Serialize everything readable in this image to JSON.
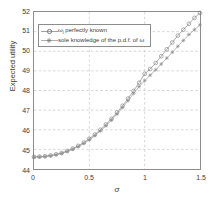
{
  "chart_data": {
    "type": "line",
    "title": "",
    "xlabel": "σ",
    "ylabel": "Expected utility",
    "xlim": [
      0,
      1.5
    ],
    "ylim": [
      44,
      52
    ],
    "xticks": [
      0,
      0.5,
      1,
      1.5
    ],
    "xtick_labels": [
      "0",
      "0.5",
      "1",
      "1.5"
    ],
    "yticks": [
      44,
      45,
      46,
      47,
      48,
      49,
      50,
      51,
      52
    ],
    "ytick_labels": [
      "44",
      "45",
      "46",
      "47",
      "48",
      "49",
      "50",
      "51",
      "52"
    ],
    "grid": true,
    "grid_style": "dashed",
    "legend_position": "upper-left",
    "series": [
      {
        "name": "ωi perfectly known",
        "label_prefix": "ω",
        "label_subscript": "i",
        "label_suffix": " perfectly known",
        "marker": "circle",
        "color": "#8a8a8a",
        "x": [
          0,
          0.05,
          0.1,
          0.15,
          0.2,
          0.25,
          0.3,
          0.35,
          0.4,
          0.45,
          0.5,
          0.55,
          0.6,
          0.65,
          0.7,
          0.75,
          0.8,
          0.85,
          0.9,
          0.95,
          1.0,
          1.05,
          1.1,
          1.15,
          1.2,
          1.25,
          1.3,
          1.35,
          1.4,
          1.45,
          1.5
        ],
        "y": [
          44.62,
          44.63,
          44.65,
          44.69,
          44.75,
          44.82,
          44.92,
          45.04,
          45.18,
          45.35,
          45.54,
          45.76,
          46.0,
          46.27,
          46.56,
          46.88,
          47.22,
          47.59,
          47.98,
          48.4,
          48.85,
          49.1,
          49.4,
          49.75,
          50.1,
          50.45,
          50.8,
          51.1,
          51.4,
          51.7,
          51.95
        ]
      },
      {
        "name": "sole knowledge of the p.d.f. of ω",
        "label_prefix": "sole knowledge of the p.d.f. of ",
        "label_subscript": "",
        "label_suffix": "ω",
        "marker": "star",
        "color": "#9a9a9a",
        "x": [
          0,
          0.05,
          0.1,
          0.15,
          0.2,
          0.25,
          0.3,
          0.35,
          0.4,
          0.45,
          0.5,
          0.55,
          0.6,
          0.65,
          0.7,
          0.75,
          0.8,
          0.85,
          0.9,
          0.95,
          1.0,
          1.05,
          1.1,
          1.15,
          1.2,
          1.25,
          1.3,
          1.35,
          1.4,
          1.45,
          1.5
        ],
        "y": [
          44.6,
          44.61,
          44.63,
          44.67,
          44.72,
          44.79,
          44.89,
          45.0,
          45.14,
          45.3,
          45.49,
          45.7,
          45.94,
          46.2,
          46.49,
          46.8,
          47.13,
          47.48,
          47.85,
          48.2,
          48.5,
          48.78,
          49.05,
          49.35,
          49.65,
          49.95,
          50.25,
          50.55,
          50.85,
          51.1,
          51.35
        ]
      }
    ]
  },
  "legend": {
    "entry_1": "ωi perfectly known",
    "entry_2": "sole knowledge of the p.d.f. of ω"
  }
}
